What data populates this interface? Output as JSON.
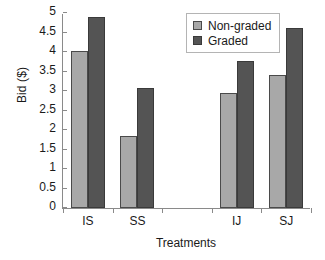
{
  "chart_data": {
    "type": "bar",
    "title": "",
    "xlabel": "Treatments",
    "ylabel": "Bid ($)",
    "categories": [
      "IS",
      "SS",
      "",
      "IJ",
      "SJ"
    ],
    "series": [
      {
        "name": "Non-graded",
        "color": "#a8a8a8",
        "values": [
          4.03,
          1.85,
          null,
          2.96,
          3.42
        ]
      },
      {
        "name": "Graded",
        "color": "#545454",
        "values": [
          4.9,
          3.07,
          null,
          3.78,
          4.61
        ]
      }
    ],
    "ylim": [
      0,
      5
    ],
    "yticks": [
      "0",
      "0.5",
      "1",
      "1.5",
      "2",
      "2.5",
      "3",
      "3.5",
      "4",
      "4.5",
      "5"
    ],
    "ytick_values": [
      0,
      0.5,
      1,
      1.5,
      2,
      2.5,
      3,
      3.5,
      4,
      4.5,
      5
    ],
    "grid": false,
    "legend_position": "top-right",
    "legend_entries": [
      "Non-graded",
      "Graded"
    ]
  }
}
